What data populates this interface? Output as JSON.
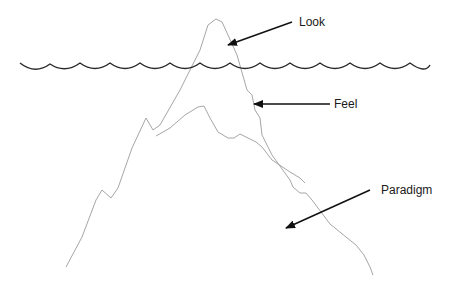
{
  "diagram": {
    "type": "iceberg",
    "labels": {
      "look": "Look",
      "feel": "Feel",
      "paradigm": "Paradigm"
    },
    "colors": {
      "outline": "#a6a6a6",
      "water": "#2b2b2b",
      "arrow": "#111111",
      "text": "#1a1a1a",
      "background": "#ffffff"
    },
    "layers": [
      {
        "name": "Look",
        "position": "above waterline (tip)"
      },
      {
        "name": "Feel",
        "position": "just below waterline"
      },
      {
        "name": "Paradigm",
        "position": "deep base"
      }
    ]
  }
}
